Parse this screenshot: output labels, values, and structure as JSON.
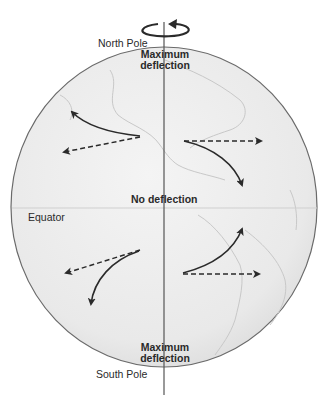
{
  "diagram": {
    "labels": {
      "north_pole": "North Pole",
      "south_pole": "South Pole",
      "equator": "Equator",
      "max_deflection_top_1": "Maximum",
      "max_deflection_top_2": "deflection",
      "no_deflection": "No deflection",
      "max_deflection_bottom_1": "Maximum",
      "max_deflection_bottom_2": "deflection"
    },
    "arrows": [
      {
        "hemisphere": "north",
        "direction": "west",
        "intended": "dashed",
        "deflected": "curves north (right)"
      },
      {
        "hemisphere": "north",
        "direction": "east",
        "intended": "dashed",
        "deflected": "curves south (right)"
      },
      {
        "hemisphere": "south",
        "direction": "west",
        "intended": "dashed",
        "deflected": "curves south (left)"
      },
      {
        "hemisphere": "south",
        "direction": "east",
        "intended": "dashed",
        "deflected": "curves north (left)"
      }
    ],
    "colors": {
      "globe_fill": "#ececec",
      "globe_edge": "#6a6a6a",
      "arrow": "#2a2a2a",
      "land_outline": "#c8c8c8",
      "axis": "#555555"
    }
  }
}
